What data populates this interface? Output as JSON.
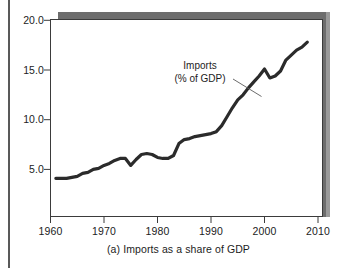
{
  "figure": {
    "caption": "(a) Imports as a share of GDP",
    "annotation_line1": "Imports",
    "annotation_line2": "(% of GDP)",
    "line_color": "#2b2b2b",
    "axis_color": "#3b3b3b",
    "shadow_color": "#6d6d6d",
    "background": "#ffffff"
  },
  "chart_data": {
    "type": "line",
    "title": "",
    "subtitle": "",
    "caption": "(a) Imports as a share of GDP",
    "xlabel": "",
    "ylabel": "",
    "series_label": "Imports (% of GDP)",
    "annotations": [
      {
        "text": "Imports",
        "x": 1993,
        "y": 16.4
      },
      {
        "text": "(% of GDP)",
        "x": 1993,
        "y": 15.2
      }
    ],
    "legend_position": "inline-annotation",
    "grid": false,
    "xlim": [
      1960,
      2010
    ],
    "ylim": [
      0,
      20
    ],
    "xticks": [
      1960,
      1970,
      1980,
      1990,
      2000,
      2010
    ],
    "xticklabels": [
      "1960",
      "1970",
      "1980",
      "1990",
      "2000",
      "2010"
    ],
    "yticks": [
      5.0,
      10.0,
      15.0,
      20.0
    ],
    "yticklabels": [
      "5.0",
      "10.0",
      "15.0",
      "20.0"
    ],
    "x": [
      1961,
      1962,
      1963,
      1964,
      1965,
      1966,
      1967,
      1968,
      1969,
      1970,
      1971,
      1972,
      1973,
      1974,
      1975,
      1976,
      1977,
      1978,
      1979,
      1980,
      1981,
      1982,
      1983,
      1984,
      1985,
      1986,
      1987,
      1988,
      1989,
      1990,
      1991,
      1992,
      1993,
      1994,
      1995,
      1996,
      1997,
      1998,
      1999,
      2000,
      2001,
      2002,
      2003,
      2004,
      2005,
      2006,
      2007,
      2008
    ],
    "values": [
      4.1,
      4.1,
      4.1,
      4.2,
      4.3,
      4.6,
      4.7,
      5.0,
      5.1,
      5.4,
      5.6,
      5.9,
      6.1,
      6.1,
      5.4,
      6.0,
      6.5,
      6.6,
      6.5,
      6.2,
      6.1,
      6.1,
      6.4,
      7.6,
      8.0,
      8.1,
      8.3,
      8.4,
      8.5,
      8.6,
      8.8,
      9.4,
      10.3,
      11.2,
      12.0,
      12.5,
      13.2,
      13.8,
      14.4,
      15.1,
      14.2,
      14.4,
      14.9,
      16.0,
      16.5,
      17.0,
      17.3,
      17.8
    ],
    "ytick_pixel_spacing_note": "5 units per ~50px",
    "line_color": "#2b2b2b",
    "line_width": 3.2
  },
  "axes": {
    "y_ticks": [
      {
        "label": "20.0",
        "value": 20.0
      },
      {
        "label": "15.0",
        "value": 15.0
      },
      {
        "label": "10.0",
        "value": 10.0
      },
      {
        "label": "5.0",
        "value": 5.0
      }
    ],
    "x_ticks": [
      {
        "label": "1960",
        "value": 1960
      },
      {
        "label": "1970",
        "value": 1970
      },
      {
        "label": "1980",
        "value": 1980
      },
      {
        "label": "1990",
        "value": 1990
      },
      {
        "label": "2000",
        "value": 2000
      },
      {
        "label": "2010",
        "value": 2010
      }
    ]
  }
}
